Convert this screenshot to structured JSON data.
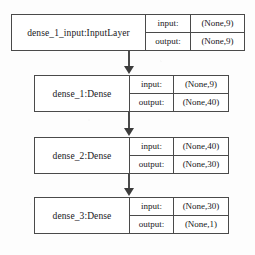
{
  "diagram": {
    "io_labels": {
      "input": "input:",
      "output": "output:"
    },
    "nodes": [
      {
        "id": "input",
        "name": "dense_1_input:InputLayer",
        "input_shape": "(None,9)",
        "output_shape": "(None,9)"
      },
      {
        "id": "dense_1",
        "name": "dense_1:Dense",
        "input_shape": "(None,9)",
        "output_shape": "(None,40)"
      },
      {
        "id": "dense_2",
        "name": "dense_2:Dense",
        "input_shape": "(None,40)",
        "output_shape": "(None,30)"
      },
      {
        "id": "dense_3",
        "name": "dense_3:Dense",
        "input_shape": "(None,30)",
        "output_shape": "(None,1)"
      }
    ],
    "edges": [
      {
        "from": "input",
        "to": "dense_1"
      },
      {
        "from": "dense_1",
        "to": "dense_2"
      },
      {
        "from": "dense_2",
        "to": "dense_3"
      }
    ],
    "colors": {
      "border": "#4a4a4a",
      "text": "#17171a",
      "background": "#fdfdfd",
      "node_fill": "#ffffff",
      "arrow": "#3c3c3c"
    }
  }
}
